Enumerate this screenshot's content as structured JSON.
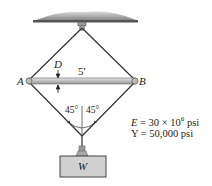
{
  "figure": {
    "labels": {
      "point_a": "A",
      "point_b": "B",
      "dimension_d": "D",
      "bar_length": "5'",
      "angle_left": "45°",
      "angle_right": "45°",
      "weight": "W"
    },
    "properties": {
      "modulus_prefix": "E = 30 × 10",
      "modulus_exp": "6",
      "modulus_unit": " psi",
      "yield": "Y = 50,000 psi"
    },
    "colors": {
      "ceiling": "#8a8a8a",
      "bar": "#c8c8c8",
      "weight_box": "#cfcfcf",
      "lines": "#333333"
    }
  }
}
